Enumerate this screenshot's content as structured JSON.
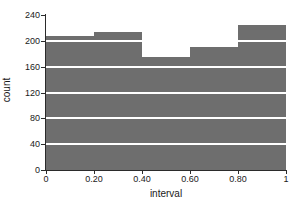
{
  "chart_data": {
    "type": "bar",
    "title": "1000 random numbers",
    "xlabel": "interval",
    "ylabel": "count",
    "categories": [
      "0.0-0.2",
      "0.2-0.4",
      "0.4-0.6",
      "0.6-0.8",
      "0.8-1.0"
    ],
    "bin_edges": [
      0,
      0.2,
      0.4,
      0.6,
      0.8,
      1
    ],
    "values": [
      208,
      214,
      175,
      190,
      224
    ],
    "xlim": [
      0,
      1
    ],
    "ylim": [
      0,
      240
    ],
    "ytick_values": [
      0,
      40,
      80,
      120,
      160,
      200,
      240
    ],
    "ytick_labels": [
      "0",
      "40",
      "80",
      "120",
      "160",
      "200",
      "240"
    ],
    "xtick_values": [
      0,
      0.2,
      0.4,
      0.6,
      0.8,
      1
    ],
    "xtick_labels": [
      "0",
      "0.20",
      "0.40",
      "0.60",
      "0.80",
      "1"
    ],
    "grid": "horizontal",
    "legend": "none",
    "bar_color": "#6e6e6e",
    "grid_color": "#ffffff",
    "axis_color": "#2b2b2b"
  }
}
